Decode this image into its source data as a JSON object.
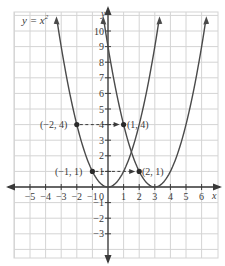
{
  "chart_data": {
    "type": "line",
    "title": "",
    "xlabel": "x",
    "ylabel": "y",
    "xlim": [
      -6,
      6.8
    ],
    "ylim": [
      -4.5,
      11.2
    ],
    "grid": true,
    "x_ticks": [
      -5,
      -4,
      -3,
      -2,
      -1,
      0,
      1,
      2,
      3,
      4,
      5,
      6
    ],
    "x_tick_labels": [
      "−5",
      "−4",
      "−3",
      "−2",
      "−1",
      "0",
      "1",
      "2",
      "3",
      "4",
      "5",
      "6"
    ],
    "y_ticks": [
      -3,
      -2,
      -1,
      1,
      2,
      3,
      4,
      5,
      6,
      7,
      8,
      9,
      10
    ],
    "y_tick_labels": [
      "−3",
      "−2",
      "−1",
      "1",
      "2",
      "3",
      "4",
      "5",
      "6",
      "7",
      "8",
      "9",
      "10"
    ],
    "series": [
      {
        "name": "y = x^2",
        "equation": "x^2",
        "h": 0,
        "x_range": [
          -3.25,
          3.25
        ]
      },
      {
        "name": "y = (x - 3)^2",
        "equation": "(x-3)^2",
        "h": 3,
        "x_range": [
          -0.25,
          6.25
        ]
      }
    ],
    "points": [
      {
        "x": -2,
        "y": 4,
        "label": "(−2, 4)"
      },
      {
        "x": 1,
        "y": 4,
        "label": "(1, 4)"
      },
      {
        "x": -1,
        "y": 1,
        "label": "(−1, 1)"
      },
      {
        "x": 2,
        "y": 1,
        "label": "(2, 1)"
      }
    ],
    "arrows": [
      {
        "from": [
          -2,
          4
        ],
        "to": [
          1,
          4
        ],
        "style": "dashed"
      },
      {
        "from": [
          -1,
          1
        ],
        "to": [
          2,
          1
        ],
        "style": "dashed"
      }
    ],
    "annotations": [
      {
        "text": "y = x²",
        "position": "top-left"
      }
    ]
  },
  "labels": {
    "equation_prefix": "y = x",
    "equation_exp": "2",
    "x_axis": "x",
    "y_axis": "y",
    "origin": "0",
    "p1": "(−2, 4)",
    "p2": "(1, 4)",
    "p3": "(−1, 1)",
    "p4": "(2, 1)"
  },
  "colors": {
    "grid": "#d4d4d4",
    "axis": "#3a3a3a",
    "curve": "#4a4a4a",
    "text": "#3a3a3a"
  }
}
